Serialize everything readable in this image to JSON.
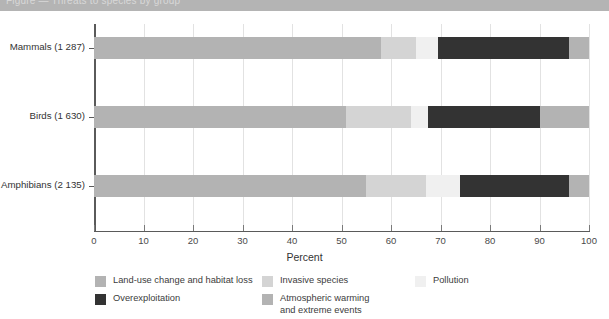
{
  "titlebar": {
    "text": "Figure — Threats to species by group"
  },
  "chart_data": {
    "type": "bar",
    "orientation": "horizontal",
    "stacked": true,
    "stacked_percent": true,
    "title": "",
    "xlabel": "Percent",
    "ylabel": "",
    "xlim": [
      0,
      100
    ],
    "grid": true,
    "legend_position": "bottom",
    "categories": [
      "Mammals (1 287)",
      "Birds (1 630)",
      "Amphibians (2 135)"
    ],
    "tick_labels": [
      "0",
      "10",
      "20",
      "30",
      "40",
      "50",
      "60",
      "70",
      "80",
      "90",
      "100"
    ],
    "tick_values": [
      0,
      10,
      20,
      30,
      40,
      50,
      60,
      70,
      80,
      90,
      100
    ],
    "series": [
      {
        "name": "Land-use change and habitat loss",
        "color": "#b3b3b3",
        "values": [
          58,
          51,
          55
        ]
      },
      {
        "name": "Invasive species",
        "color": "#d4d4d4",
        "values": [
          7,
          13,
          12
        ]
      },
      {
        "name": "Pollution",
        "color": "#f0f0f0",
        "values": [
          4.5,
          3.5,
          7
        ]
      },
      {
        "name": "Overexploitation",
        "color": "#333333",
        "values": [
          26.5,
          22.5,
          22
        ]
      },
      {
        "name": "Atmospheric warming and extreme events",
        "color": "#b3b3b3",
        "values": [
          4,
          10,
          4
        ]
      }
    ]
  },
  "legend": {
    "items": [
      {
        "label": "Land-use change and habitat loss",
        "color": "#b3b3b3"
      },
      {
        "label": "Overexploitation",
        "color": "#333333"
      },
      {
        "label": "Invasive species",
        "color": "#d4d4d4"
      },
      {
        "label": "Atmospheric warming\nand extreme events",
        "color": "#b3b3b3"
      },
      {
        "label": "Pollution",
        "color": "#f0f0f0"
      }
    ]
  }
}
